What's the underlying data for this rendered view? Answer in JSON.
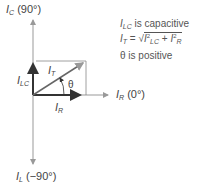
{
  "axes": {
    "top": {
      "symbol": "I",
      "sub": "C",
      "angle": "(90°)"
    },
    "right": {
      "symbol": "I",
      "sub": "R",
      "angle": "(0°)"
    },
    "bottom": {
      "symbol": "I",
      "sub": "L",
      "angle": "(−90°)"
    }
  },
  "vectors": {
    "lc": {
      "symbol": "I",
      "sub": "LC"
    },
    "r": {
      "symbol": "I",
      "sub": "R"
    },
    "t": {
      "symbol": "I",
      "sub": "T"
    },
    "angle": "θ"
  },
  "notes": {
    "line1_sym": "I",
    "line1_sub": "LC",
    "line1_text": " is capacitive",
    "line2_lhs": "I",
    "line2_lhs_sub": "T",
    "line2_eq": " = √",
    "line2_a": "I",
    "line2_a_sub": "LC",
    "line2_a_sup": "2",
    "line2_plus": " + ",
    "line2_b": "I",
    "line2_b_sub": "R",
    "line2_b_sup": "2",
    "line3": "θ is positive"
  },
  "colors": {
    "axis": "#999999",
    "vector": "#333333",
    "box": "#888888"
  }
}
